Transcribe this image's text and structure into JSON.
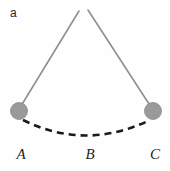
{
  "figure": {
    "panel_letter": "a",
    "background_color": "#fefefe",
    "caption_labels": [
      {
        "id": "A",
        "text": "A",
        "x": 19,
        "y": 154,
        "meaning": "left extreme position of pendulum bob"
      },
      {
        "id": "B",
        "text": "B",
        "x": 86,
        "y": 154,
        "meaning": "lowest point of swing"
      },
      {
        "id": "C",
        "text": "C",
        "x": 152,
        "y": 154,
        "meaning": "right extreme position of pendulum bob"
      }
    ],
    "pivot": {
      "x_left": 79,
      "y_left": 11,
      "x_right": 88,
      "y_right": 10
    },
    "strings": [
      {
        "name": "left-pendulum-string",
        "x1": 79,
        "y1": 11,
        "x2": 21,
        "y2": 106,
        "color": "#8f8f8f",
        "width": 1.6
      },
      {
        "name": "right-pendulum-string",
        "x1": 88,
        "y1": 10,
        "x2": 151,
        "y2": 107,
        "color": "#8f8f8f",
        "width": 1.6
      }
    ],
    "bobs": [
      {
        "name": "left-pendulum-bob",
        "cx": 19,
        "cy": 111,
        "r": 8.5,
        "fill": "#9a9a9a",
        "stroke": "#8a8a8a"
      },
      {
        "name": "right-pendulum-bob",
        "cx": 153,
        "cy": 111,
        "r": 8.5,
        "fill": "#9a9a9a",
        "stroke": "#8a8a8a"
      }
    ],
    "trajectory_arc": {
      "name": "swing-trajectory-arc",
      "start_x": 23,
      "start_y": 120,
      "control_x": 86,
      "control_y": 151,
      "end_x": 150,
      "end_y": 120,
      "color": "#1a1a1a",
      "width": 2.6,
      "dash": "7 5",
      "style": "dashed"
    }
  }
}
